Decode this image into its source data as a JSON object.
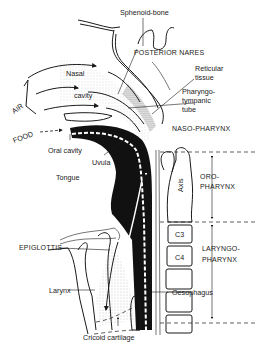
{
  "figure": {
    "labels": {
      "sphenoid_bone": "Sphenoid-bone",
      "posterior_nares": "POSTERIOR NARES",
      "reticular_tissue_1": "Reticular",
      "reticular_tissue_2": "tissue",
      "pharyngotympanic_1": "Pharyngo-",
      "pharyngotympanic_2": "tympanic",
      "pharyngotympanic_3": "tube",
      "nasal": "Nasal",
      "cavity": "cavity",
      "air": "AIR",
      "food": "FOOD",
      "oral_cavity": "Oral cavity",
      "uvula": "Uvula",
      "tongue": "Tongue",
      "nasopharynx": "NASO-PHARYNX",
      "axis": "Axis",
      "oropharynx_1": "ORO-",
      "oropharynx_2": "PHARYNX",
      "c3": "C3",
      "c4": "C4",
      "laryngopharynx_1": "LARYNGO-",
      "laryngopharynx_2": "PHARYNX",
      "epiglottis": "EPIGLOTTIS",
      "larynx": "Larynx",
      "oesophagus": "Oesophagus",
      "cricoid_cartilage": "Cricoid cartilage"
    },
    "colors": {
      "ink": "#1a1a1a",
      "background": "#ffffff",
      "stipple": "#8a8a8a"
    }
  }
}
